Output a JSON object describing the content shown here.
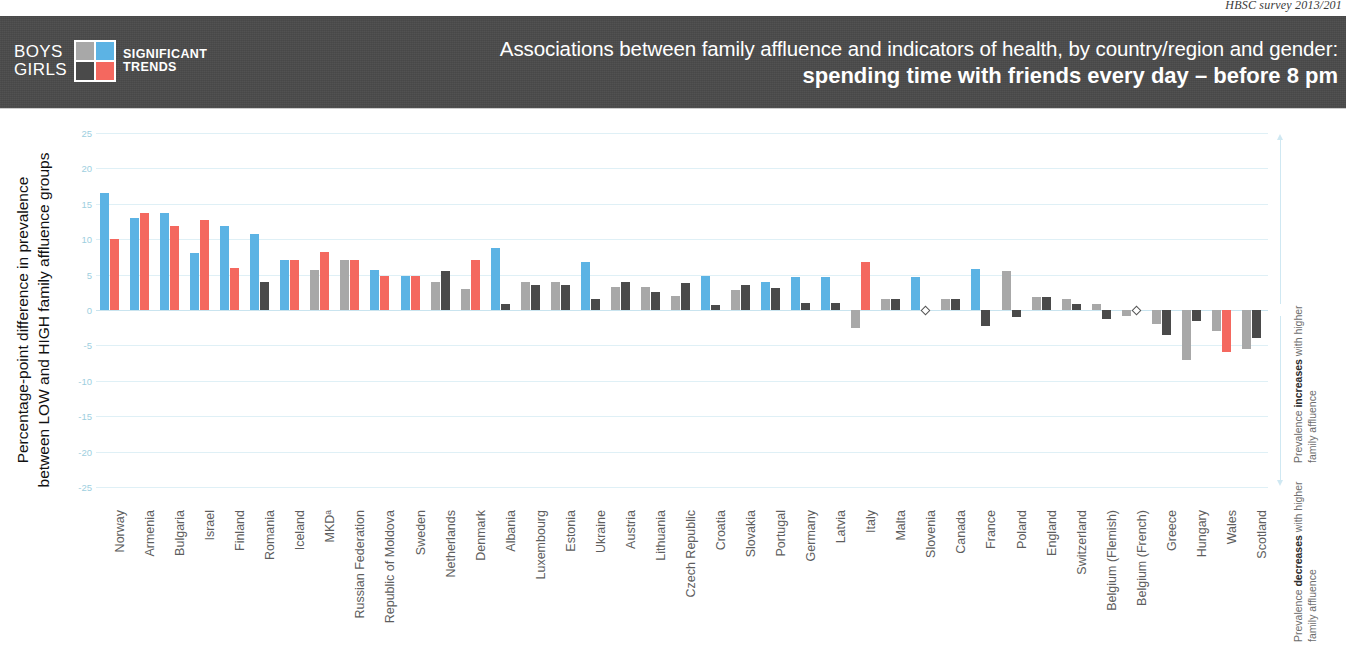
{
  "source_note": "HBSC survey 2013/201",
  "legend": {
    "gender": [
      "BOYS",
      "GIRLS"
    ],
    "trend": [
      "SIGNIFICANT",
      "TRENDS"
    ],
    "swatches": {
      "boys_nonsig": "#a8a8a8",
      "boys_sig": "#5cb3e4",
      "girls_nonsig": "#4a4a4a",
      "girls_sig": "#f4685f"
    }
  },
  "header": {
    "title_line1": "Associations between family affluence and indicators of health, by country/region and gender:",
    "title_line2": "spending time with friends every day – before 8 pm",
    "background": "#4a4a4a"
  },
  "annotations": {
    "increase": "Prevalence <b>increases</b> with higher family affluence",
    "decrease": "Prevalence <b>decreases</b> with higher family affluence",
    "increase_plain": "Prevalence increases with higher family affluence",
    "decrease_plain": "Prevalence decreases with higher family affluence"
  },
  "chart_data": {
    "type": "bar",
    "title": "Associations between family affluence and indicators of health, by country/region and gender: spending time with friends every day – before 8 pm",
    "xlabel": "",
    "ylabel": "Percentage-point difference in prevalence between LOW and HIGH family affluence groups",
    "ylim": [
      -25,
      25
    ],
    "yticks": [
      25,
      20,
      15,
      10,
      5,
      0,
      -5,
      -10,
      -15,
      -20,
      -25
    ],
    "ytick_labels": [
      "25",
      "20",
      "15",
      "10",
      "5",
      "0",
      "-5",
      "-10",
      "-15",
      "-20",
      "-25"
    ],
    "grid": true,
    "legend_position": "header-left",
    "series": [
      {
        "name": "Boys",
        "colors": {
          "significant": "#5cb3e4",
          "non_significant": "#a8a8a8"
        }
      },
      {
        "name": "Girls",
        "colors": {
          "significant": "#f4685f",
          "non_significant": "#4a4a4a"
        }
      }
    ],
    "categories": [
      "Norway",
      "Armenia",
      "Bulgaria",
      "Israel",
      "Finland",
      "Romania",
      "Iceland",
      "MKD",
      "Russian Federation",
      "Republic of Moldova",
      "Sweden",
      "Netherlands",
      "Denmark",
      "Albania",
      "Luxembourg",
      "Estonia",
      "Ukraine",
      "Austria",
      "Lithuania",
      "Czech Republic",
      "Croatia",
      "Slovakia",
      "Portugal",
      "Germany",
      "Latvia",
      "Italy",
      "Malta",
      "Slovenia",
      "Canada",
      "France",
      "Poland",
      "England",
      "Switzerland",
      "Belgium (Flemish)",
      "Belgium (French)",
      "Greece",
      "Hungary",
      "Wales",
      "Scotland"
    ],
    "category_labels": [
      "Norway",
      "Armenia",
      "Bulgaria",
      "Israel",
      "Finland",
      "Romania",
      "Iceland",
      "MKDᵃ",
      "Russian Federation",
      "Republic of Moldova",
      "Sweden",
      "Netherlands",
      "Denmark",
      "Albania",
      "Luxembourg",
      "Estonia",
      "Ukraine",
      "Austria",
      "Lithuania",
      "Czech Republic",
      "Croatia",
      "Slovakia",
      "Portugal",
      "Germany",
      "Latvia",
      "Italy",
      "Malta",
      "Slovenia",
      "Canada",
      "France",
      "Poland",
      "England",
      "Switzerland",
      "Belgium (Flemish)",
      "Belgium (French)",
      "Greece",
      "Hungary",
      "Wales",
      "Scotland"
    ],
    "bars": [
      {
        "country": "Norway",
        "boys": 16.5,
        "boys_sig": true,
        "girls": 10.0,
        "girls_sig": true
      },
      {
        "country": "Armenia",
        "boys": 13.0,
        "boys_sig": true,
        "girls": 13.7,
        "girls_sig": true
      },
      {
        "country": "Bulgaria",
        "boys": 13.7,
        "boys_sig": true,
        "girls": 11.8,
        "girls_sig": true
      },
      {
        "country": "Israel",
        "boys": 8.0,
        "boys_sig": true,
        "girls": 12.7,
        "girls_sig": true
      },
      {
        "country": "Finland",
        "boys": 11.8,
        "boys_sig": true,
        "girls": 6.0,
        "girls_sig": true
      },
      {
        "country": "Romania",
        "boys": 10.7,
        "boys_sig": true,
        "girls": 4.0,
        "girls_sig": false
      },
      {
        "country": "Iceland",
        "boys": 7.0,
        "boys_sig": true,
        "girls": 7.0,
        "girls_sig": true
      },
      {
        "country": "MKD",
        "boys": 5.7,
        "boys_sig": false,
        "girls": 8.2,
        "girls_sig": true
      },
      {
        "country": "Russian Federation",
        "boys": 7.0,
        "boys_sig": false,
        "girls": 7.0,
        "girls_sig": true
      },
      {
        "country": "Republic of Moldova",
        "boys": 5.7,
        "boys_sig": true,
        "girls": 4.8,
        "girls_sig": true
      },
      {
        "country": "Sweden",
        "boys": 4.8,
        "boys_sig": true,
        "girls": 4.8,
        "girls_sig": true
      },
      {
        "country": "Netherlands",
        "boys": 4.0,
        "boys_sig": false,
        "girls": 5.5,
        "girls_sig": false
      },
      {
        "country": "Denmark",
        "boys": 3.0,
        "boys_sig": false,
        "girls": 7.0,
        "girls_sig": true
      },
      {
        "country": "Albania",
        "boys": 8.8,
        "boys_sig": true,
        "girls": 0.8,
        "girls_sig": false
      },
      {
        "country": "Luxembourg",
        "boys": 4.0,
        "boys_sig": false,
        "girls": 3.5,
        "girls_sig": false
      },
      {
        "country": "Estonia",
        "boys": 4.0,
        "boys_sig": false,
        "girls": 3.5,
        "girls_sig": false
      },
      {
        "country": "Ukraine",
        "boys": 6.8,
        "boys_sig": true,
        "girls": 1.5,
        "girls_sig": false
      },
      {
        "country": "Austria",
        "boys": 3.3,
        "boys_sig": false,
        "girls": 4.0,
        "girls_sig": false
      },
      {
        "country": "Lithuania",
        "boys": 3.3,
        "boys_sig": false,
        "girls": 2.6,
        "girls_sig": false
      },
      {
        "country": "Czech Republic",
        "boys": 2.0,
        "boys_sig": false,
        "girls": 3.8,
        "girls_sig": false
      },
      {
        "country": "Croatia",
        "boys": 4.8,
        "boys_sig": true,
        "girls": 0.7,
        "girls_sig": false
      },
      {
        "country": "Slovakia",
        "boys": 2.8,
        "boys_sig": false,
        "girls": 3.5,
        "girls_sig": false
      },
      {
        "country": "Portugal",
        "boys": 4.0,
        "boys_sig": true,
        "girls": 3.1,
        "girls_sig": false
      },
      {
        "country": "Germany",
        "boys": 4.7,
        "boys_sig": true,
        "girls": 1.0,
        "girls_sig": false
      },
      {
        "country": "Latvia",
        "boys": 4.7,
        "boys_sig": true,
        "girls": 1.0,
        "girls_sig": false
      },
      {
        "country": "Italy",
        "boys": -2.5,
        "boys_sig": false,
        "girls": 6.8,
        "girls_sig": true
      },
      {
        "country": "Malta",
        "boys": 1.5,
        "boys_sig": false,
        "girls": 1.5,
        "girls_sig": false
      },
      {
        "country": "Slovenia",
        "boys": 4.7,
        "boys_sig": true,
        "girls": 0.0,
        "girls_sig": false
      },
      {
        "country": "Canada",
        "boys": 1.5,
        "boys_sig": false,
        "girls": 1.5,
        "girls_sig": false
      },
      {
        "country": "France",
        "boys": 5.8,
        "boys_sig": true,
        "girls": -2.2,
        "girls_sig": false
      },
      {
        "country": "Poland",
        "boys": 5.5,
        "boys_sig": false,
        "girls": -1.0,
        "girls_sig": false
      },
      {
        "country": "England",
        "boys": 1.8,
        "boys_sig": false,
        "girls": 1.8,
        "girls_sig": false
      },
      {
        "country": "Switzerland",
        "boys": 1.6,
        "boys_sig": false,
        "girls": 0.8,
        "girls_sig": false
      },
      {
        "country": "Belgium (Flemish)",
        "boys": 0.8,
        "boys_sig": false,
        "girls": -1.3,
        "girls_sig": false
      },
      {
        "country": "Belgium (French)",
        "boys": -0.8,
        "boys_sig": false,
        "girls": 0.0,
        "girls_sig": false
      },
      {
        "country": "Greece",
        "boys": -2.0,
        "boys_sig": false,
        "girls": -3.5,
        "girls_sig": false
      },
      {
        "country": "Hungary",
        "boys": -7.0,
        "boys_sig": false,
        "girls": -1.5,
        "girls_sig": false
      },
      {
        "country": "Wales",
        "boys": -3.0,
        "boys_sig": false,
        "girls": -6.0,
        "girls_sig": true
      },
      {
        "country": "Scotland",
        "boys": -5.5,
        "boys_sig": false,
        "girls": -4.0,
        "girls_sig": false
      }
    ],
    "zero_markers": [
      "Slovenia",
      "Belgium (French)"
    ]
  }
}
